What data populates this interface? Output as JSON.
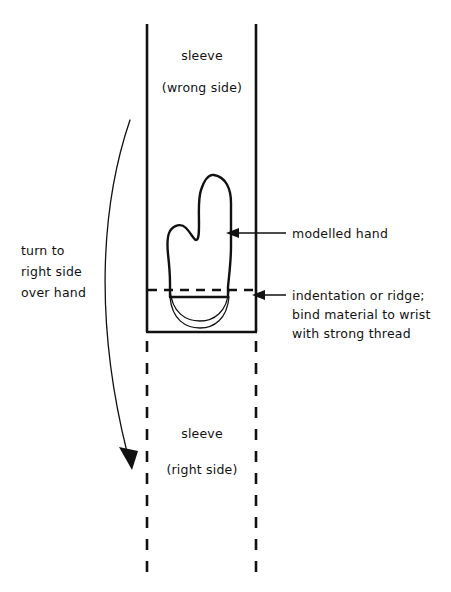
{
  "figure": {
    "background_color": "#ffffff",
    "ink_color": "#111111"
  },
  "labels": {
    "sleeve_top_line1": "sleeve",
    "sleeve_top_line2": "(wrong side)",
    "sleeve_bottom_line1": "sleeve",
    "sleeve_bottom_line2": "(right side)",
    "turn_line1": "turn to",
    "turn_line2": "right side",
    "turn_line3": "over hand",
    "callout_hand": "modelled hand",
    "callout_ridge_line1": "indentation or ridge;",
    "callout_ridge_line2": "bind material to wrist",
    "callout_ridge_line3": "with strong thread"
  },
  "icons": {
    "turn_arrow": "curved-down-arrow-icon",
    "hand_leader_arrow": "left-arrow-icon",
    "ridge_leader_arrow": "left-arrow-icon"
  },
  "geometry": {
    "sleeve_left_x": 147,
    "sleeve_right_x": 256,
    "sleeve_solid_top_y": 24,
    "sleeve_solid_bottom_y": 332,
    "sleeve_dashed_bottom_y": 572
  }
}
